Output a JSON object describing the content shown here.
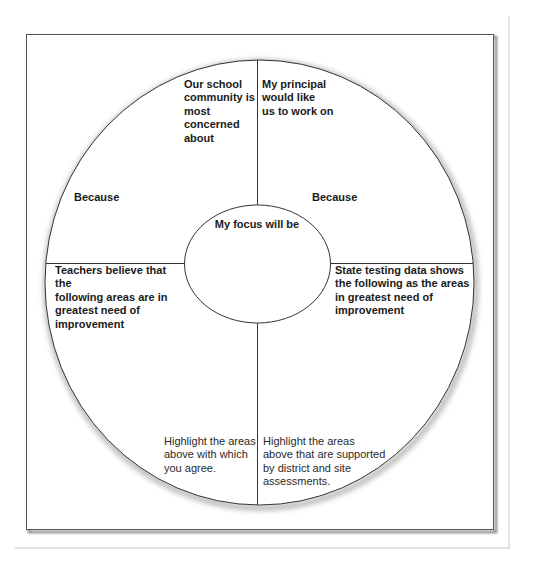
{
  "diagram": {
    "type": "circular planning organizer",
    "quadrants": {
      "top_left": {
        "prompt": "Our school\ncommunity is\nmost\nconcerned\nabout",
        "because": "Because"
      },
      "top_right": {
        "prompt": "My principal\nwould like\nus to work on",
        "because": "Because"
      },
      "bottom_left": {
        "prompt": "Teachers believe that the\nfollowing areas are in\ngreatest need of\nimprovement",
        "instruction": "Highlight the areas\nabove with which\nyou agree."
      },
      "bottom_right": {
        "prompt": "State testing data shows\nthe following as the areas\nin greatest need of\nimprovement",
        "instruction": "Highlight the areas\nabove that are supported\nby district and site\nassessments."
      }
    },
    "center": {
      "label": "My focus will be"
    }
  },
  "colors": {
    "line": "#333333",
    "frame": "#555555",
    "shadow": "#b5b5b5",
    "background": "#ffffff"
  }
}
